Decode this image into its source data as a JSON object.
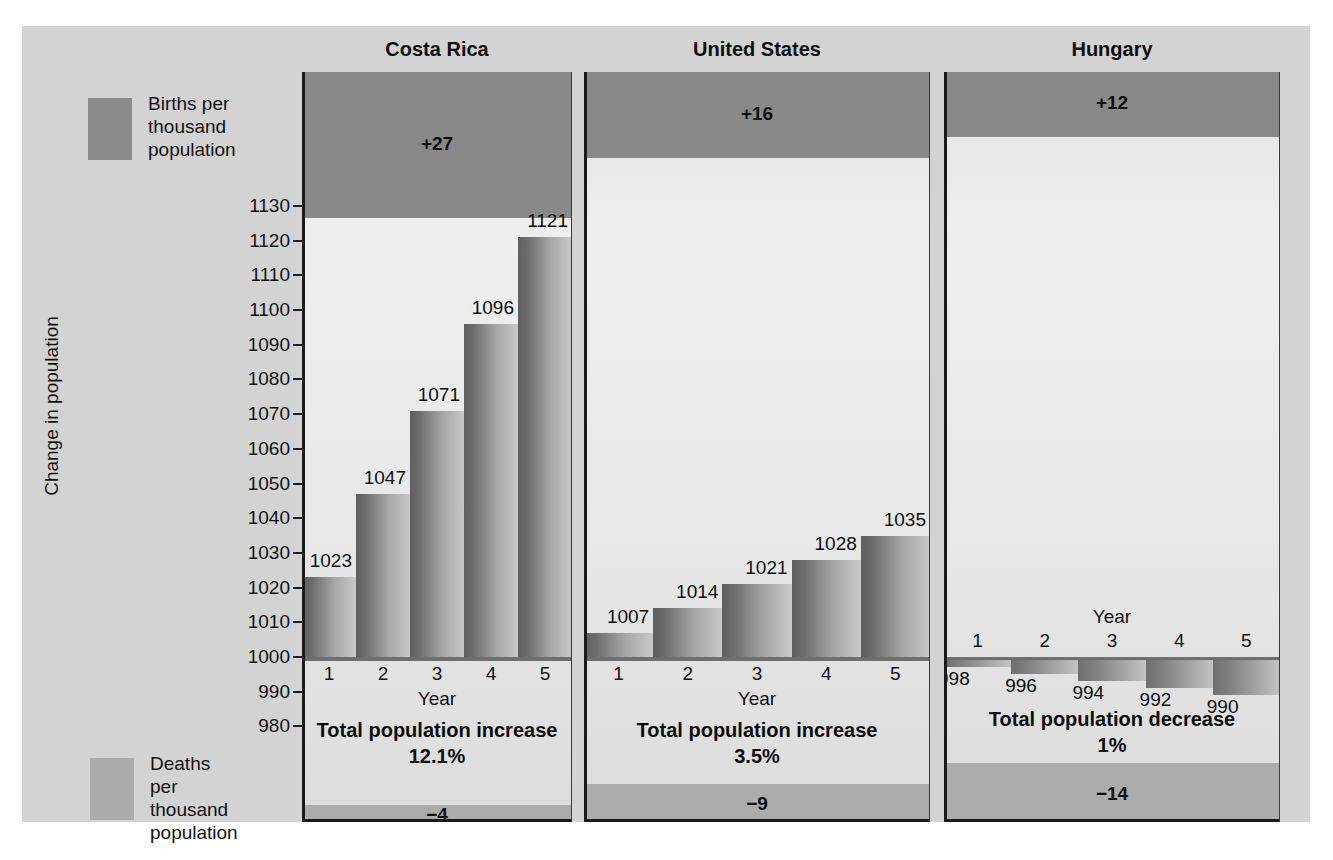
{
  "figure": {
    "y_axis_title": "Change in population",
    "x_axis_title": "Year",
    "legend": [
      {
        "name": "births",
        "label": "Births per\nthousand\npopulation",
        "color": "#8b8b8b"
      },
      {
        "name": "deaths",
        "label": "Deaths per\nthousand\npopulation",
        "color": "#ababab"
      }
    ],
    "y_ticks": [
      "1130",
      "1120",
      "1110",
      "1100",
      "1090",
      "1080",
      "1070",
      "1060",
      "1050",
      "1040",
      "1030",
      "1020",
      "1010",
      "1000",
      "990",
      "980"
    ],
    "x_ticks": [
      "1",
      "2",
      "3",
      "4",
      "5"
    ]
  },
  "chart_data": {
    "type": "bar",
    "title": "Change in population",
    "xlabel": "Year",
    "ylabel": "Change in population",
    "ylim": [
      980,
      1130
    ],
    "grid": false,
    "legend_position": "left",
    "categories": [
      "1",
      "2",
      "3",
      "4",
      "5"
    ],
    "baseline": 1000,
    "panels": [
      {
        "name": "costa-rica",
        "title": "Costa Rica",
        "births_per_thousand": "+27",
        "births_value": 27,
        "deaths_per_thousand": "−4",
        "deaths_value": -4,
        "values": [
          1023,
          1047,
          1071,
          1096,
          1121
        ],
        "value_labels": [
          "1023",
          "1047",
          "1071",
          "1096",
          "1121"
        ],
        "total_label": "Total population increase",
        "total_value": "12.1%"
      },
      {
        "name": "united-states",
        "title": "United States",
        "births_per_thousand": "+16",
        "births_value": 16,
        "deaths_per_thousand": "−9",
        "deaths_value": -9,
        "values": [
          1007,
          1014,
          1021,
          1028,
          1035
        ],
        "value_labels": [
          "1007",
          "1014",
          "1021",
          "1028",
          "1035"
        ],
        "total_label": "Total population increase",
        "total_value": "3.5%"
      },
      {
        "name": "hungary",
        "title": "Hungary",
        "births_per_thousand": "+12",
        "births_value": 12,
        "deaths_per_thousand": "−14",
        "deaths_value": -14,
        "values": [
          998,
          996,
          994,
          992,
          990
        ],
        "value_labels": [
          "998",
          "996",
          "994",
          "992",
          "990"
        ],
        "total_label": "Total population decrease",
        "total_value": "1%"
      }
    ]
  }
}
